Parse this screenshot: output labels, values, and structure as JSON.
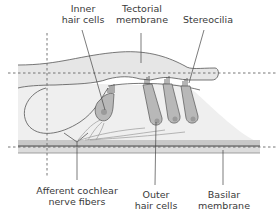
{
  "labels": {
    "inner_hair_cells": {
      "line1": "Inner",
      "line2": "hair cells"
    },
    "tectorial_membrane": {
      "line1": "Tectorial",
      "line2": "membrane"
    },
    "stereocilia": {
      "line1": "Stereocilia"
    },
    "afferent_nerve": {
      "line1": "Afferent cochlear",
      "line2": "nerve fibers"
    },
    "outer_hair_cells": {
      "line1": "Outer",
      "line2": "hair cells"
    },
    "basilar_membrane": {
      "line1": "Basilar",
      "line2": "membrane"
    }
  },
  "colors": {
    "organ_fill": "#efefef",
    "cell_fill": "#b8b8b8",
    "nucleus_fill": "#9a9a9a",
    "line": "#555555",
    "membrane_dark": "#9c9c9c",
    "membrane_light": "#d4d4d4",
    "label_text": "#3a3a3a"
  }
}
